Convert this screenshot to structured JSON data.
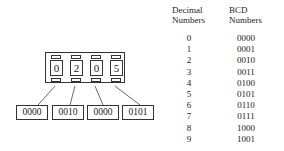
{
  "diagram": {
    "display_digits": [
      "0",
      "2",
      "0",
      "5"
    ],
    "bcd_groups": [
      "0000",
      "0010",
      "0000",
      "0101"
    ]
  },
  "table": {
    "headers": {
      "decimal": [
        "Decimal",
        "Numbers"
      ],
      "bcd": [
        "BCD",
        "Numbers"
      ]
    },
    "rows": [
      {
        "decimal": "0",
        "bcd": "0000"
      },
      {
        "decimal": "1",
        "bcd": "0001"
      },
      {
        "decimal": "2",
        "bcd": "0010"
      },
      {
        "decimal": "3",
        "bcd": "0011"
      },
      {
        "decimal": "4",
        "bcd": "0100"
      },
      {
        "decimal": "5",
        "bcd": "0101"
      },
      {
        "decimal": "6",
        "bcd": "0110"
      },
      {
        "decimal": "7",
        "bcd": "0111"
      },
      {
        "decimal": "8",
        "bcd": "1000"
      },
      {
        "decimal": "9",
        "bcd": "1001"
      }
    ]
  }
}
